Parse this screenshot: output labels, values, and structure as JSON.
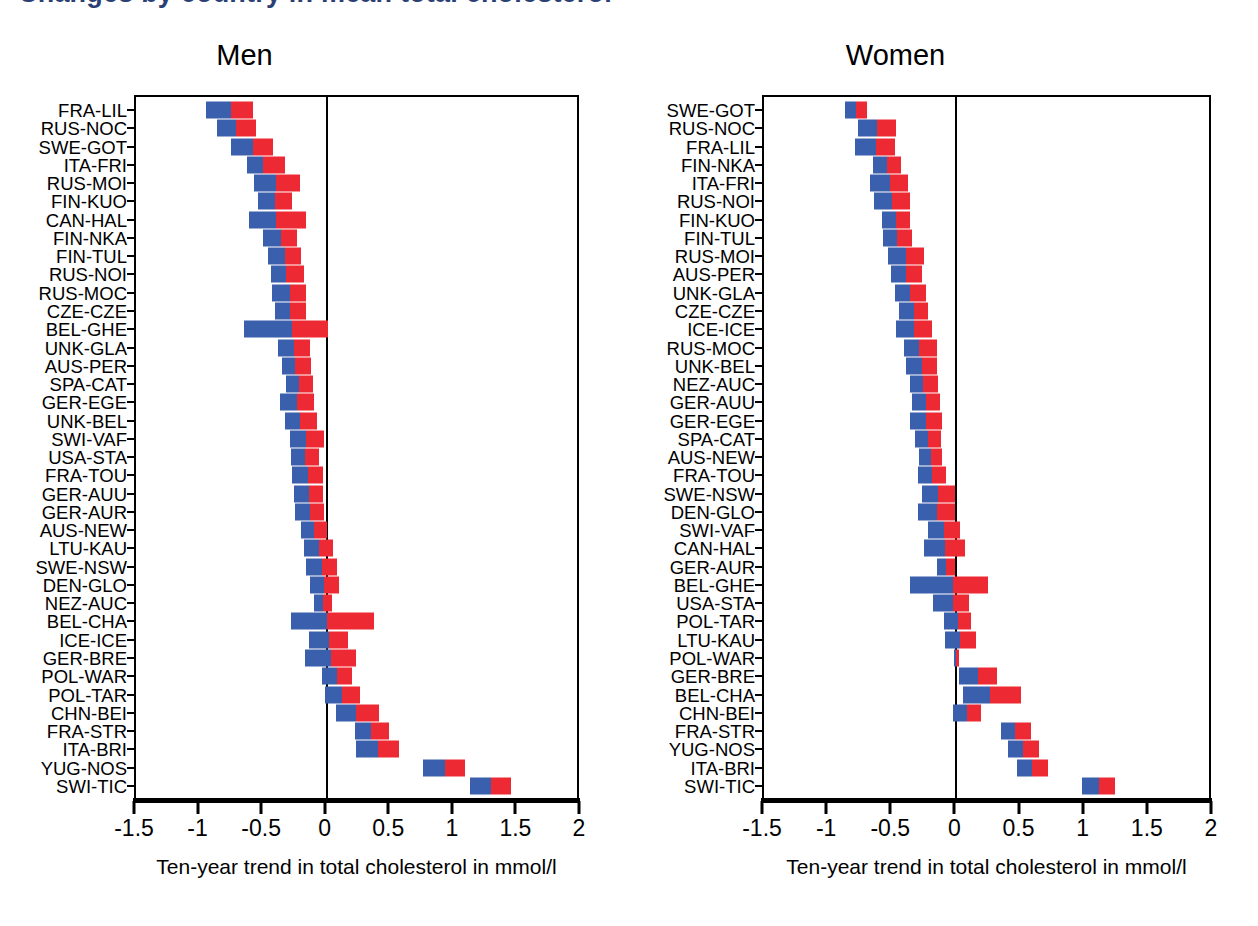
{
  "figure": {
    "cut_heading": "Changes by country in mean total cholesterol",
    "accent_blue": "#3a5fad",
    "accent_red": "#ed2a33",
    "axis_title": "Ten-year trend in total cholesterol in mmol/l"
  },
  "chart_data": [
    {
      "type": "bar",
      "orientation": "horizontal",
      "title": "Men",
      "xlabel": "Ten-year trend in total cholesterol in mmol/l",
      "ylabel": "",
      "xlim": [
        -1.5,
        2
      ],
      "xticks": [
        -1.5,
        -1,
        -0.5,
        0,
        0.5,
        1,
        1.5,
        2
      ],
      "xticklabels": [
        "-1.5",
        "-1",
        "-0.5",
        "0",
        "0.5",
        "1",
        "1.5",
        "2"
      ],
      "grid": false,
      "legend": "none",
      "zero_reference_line": 0,
      "series": [
        {
          "name": "lower-half (blue)",
          "color": "#3a5fad"
        },
        {
          "name": "upper-half (red)",
          "color": "#ed2a33"
        }
      ],
      "categories": [
        "FRA-LIL",
        "RUS-NOC",
        "SWE-GOT",
        "ITA-FRI",
        "RUS-MOI",
        "FIN-KUO",
        "CAN-HAL",
        "FIN-NKA",
        "FIN-TUL",
        "RUS-NOI",
        "RUS-MOC",
        "CZE-CZE",
        "BEL-GHE",
        "UNK-GLA",
        "AUS-PER",
        "SPA-CAT",
        "GER-EGE",
        "UNK-BEL",
        "SWI-VAF",
        "USA-STA",
        "FRA-TOU",
        "GER-AUU",
        "GER-AUR",
        "AUS-NEW",
        "LTU-KAU",
        "SWE-NSW",
        "DEN-GLO",
        "NEZ-AUC",
        "BEL-CHA",
        "ICE-ICE",
        "GER-BRE",
        "POL-WAR",
        "POL-TAR",
        "CHN-BEI",
        "FRA-STR",
        "ITA-BRI",
        "YUG-NOS",
        "SWI-TIC"
      ],
      "points": [
        {
          "category": "FRA-LIL",
          "low": -0.95,
          "mid": -0.75,
          "high": -0.58
        },
        {
          "category": "RUS-NOC",
          "low": -0.86,
          "mid": -0.71,
          "high": -0.56
        },
        {
          "category": "SWE-GOT",
          "low": -0.75,
          "mid": -0.58,
          "high": -0.42
        },
        {
          "category": "ITA-FRI",
          "low": -0.63,
          "mid": -0.5,
          "high": -0.33
        },
        {
          "category": "RUS-MOI",
          "low": -0.57,
          "mid": -0.4,
          "high": -0.21
        },
        {
          "category": "FIN-KUO",
          "low": -0.54,
          "mid": -0.41,
          "high": -0.27
        },
        {
          "category": "CAN-HAL",
          "low": -0.61,
          "mid": -0.4,
          "high": -0.16
        },
        {
          "category": "FIN-NKA",
          "low": -0.5,
          "mid": -0.36,
          "high": -0.23
        },
        {
          "category": "FIN-TUL",
          "low": -0.46,
          "mid": -0.33,
          "high": -0.2
        },
        {
          "category": "RUS-NOI",
          "low": -0.44,
          "mid": -0.32,
          "high": -0.18
        },
        {
          "category": "RUS-MOC",
          "low": -0.43,
          "mid": -0.29,
          "high": -0.16
        },
        {
          "category": "CZE-CZE",
          "low": -0.41,
          "mid": -0.29,
          "high": -0.16
        },
        {
          "category": "BEL-GHE",
          "low": -0.65,
          "mid": -0.27,
          "high": 0.01
        },
        {
          "category": "UNK-GLA",
          "low": -0.38,
          "mid": -0.26,
          "high": -0.13
        },
        {
          "category": "AUS-PER",
          "low": -0.35,
          "mid": -0.25,
          "high": -0.12
        },
        {
          "category": "SPA-CAT",
          "low": -0.32,
          "mid": -0.22,
          "high": -0.11
        },
        {
          "category": "GER-EGE",
          "low": -0.37,
          "mid": -0.23,
          "high": -0.1
        },
        {
          "category": "UNK-BEL",
          "low": -0.33,
          "mid": -0.21,
          "high": -0.08
        },
        {
          "category": "SWI-VAF",
          "low": -0.29,
          "mid": -0.16,
          "high": -0.02
        },
        {
          "category": "USA-STA",
          "low": -0.28,
          "mid": -0.17,
          "high": -0.06
        },
        {
          "category": "FRA-TOU",
          "low": -0.27,
          "mid": -0.15,
          "high": -0.03
        },
        {
          "category": "GER-AUU",
          "low": -0.26,
          "mid": -0.14,
          "high": -0.03
        },
        {
          "category": "GER-AUR",
          "low": -0.25,
          "mid": -0.13,
          "high": -0.02
        },
        {
          "category": "AUS-NEW",
          "low": -0.2,
          "mid": -0.1,
          "high": 0.0
        },
        {
          "category": "LTU-KAU",
          "low": -0.18,
          "mid": -0.06,
          "high": 0.05
        },
        {
          "category": "SWE-NSW",
          "low": -0.16,
          "mid": -0.04,
          "high": 0.08
        },
        {
          "category": "DEN-GLO",
          "low": -0.13,
          "mid": -0.02,
          "high": 0.1
        },
        {
          "category": "NEZ-AUC",
          "low": -0.1,
          "mid": -0.03,
          "high": 0.04
        },
        {
          "category": "BEL-CHA",
          "low": -0.28,
          "mid": 0.0,
          "high": 0.37
        },
        {
          "category": "ICE-ICE",
          "low": -0.14,
          "mid": 0.02,
          "high": 0.17
        },
        {
          "category": "GER-BRE",
          "low": -0.17,
          "mid": 0.03,
          "high": 0.23
        },
        {
          "category": "POL-WAR",
          "low": -0.04,
          "mid": 0.08,
          "high": 0.2
        },
        {
          "category": "POL-TAR",
          "low": -0.01,
          "mid": 0.12,
          "high": 0.26
        },
        {
          "category": "CHN-BEI",
          "low": 0.07,
          "mid": 0.23,
          "high": 0.41
        },
        {
          "category": "FRA-STR",
          "low": 0.22,
          "mid": 0.35,
          "high": 0.49
        },
        {
          "category": "ITA-BRI",
          "low": 0.23,
          "mid": 0.4,
          "high": 0.57
        },
        {
          "category": "YUG-NOS",
          "low": 0.76,
          "mid": 0.93,
          "high": 1.09
        },
        {
          "category": "SWI-TIC",
          "low": 1.13,
          "mid": 1.29,
          "high": 1.45
        }
      ]
    },
    {
      "type": "bar",
      "orientation": "horizontal",
      "title": "Women",
      "xlabel": "Ten-year trend in total cholesterol in mmol/l",
      "ylabel": "",
      "xlim": [
        -1.5,
        2
      ],
      "xticks": [
        -1.5,
        -1,
        -0.5,
        0,
        0.5,
        1,
        1.5,
        2
      ],
      "xticklabels": [
        "-1.5",
        "-1",
        "-0.5",
        "0",
        "0.5",
        "1",
        "1.5",
        "2"
      ],
      "grid": false,
      "legend": "none",
      "zero_reference_line": 0,
      "series": [
        {
          "name": "lower-half (blue)",
          "color": "#3a5fad"
        },
        {
          "name": "upper-half (red)",
          "color": "#ed2a33"
        }
      ],
      "categories": [
        "SWE-GOT",
        "RUS-NOC",
        "FRA-LIL",
        "FIN-NKA",
        "ITA-FRI",
        "RUS-NOI",
        "FIN-KUO",
        "FIN-TUL",
        "RUS-MOI",
        "AUS-PER",
        "UNK-GLA",
        "CZE-CZE",
        "ICE-ICE",
        "RUS-MOC",
        "UNK-BEL",
        "NEZ-AUC",
        "GER-AUU",
        "GER-EGE",
        "SPA-CAT",
        "AUS-NEW",
        "FRA-TOU",
        "SWE-NSW",
        "DEN-GLO",
        "SWI-VAF",
        "CAN-HAL",
        "GER-AUR",
        "BEL-GHE",
        "USA-STA",
        "POL-TAR",
        "LTU-KAU",
        "POL-WAR",
        "GER-BRE",
        "BEL-CHA",
        "CHN-BEI",
        "FRA-STR",
        "YUG-NOS",
        "ITA-BRI",
        "SWI-TIC"
      ],
      "points": [
        {
          "category": "SWE-GOT",
          "low": -0.87,
          "mid": -0.78,
          "high": -0.7
        },
        {
          "category": "RUS-NOC",
          "low": -0.77,
          "mid": -0.62,
          "high": -0.47
        },
        {
          "category": "FRA-LIL",
          "low": -0.79,
          "mid": -0.63,
          "high": -0.48
        },
        {
          "category": "FIN-NKA",
          "low": -0.65,
          "mid": -0.54,
          "high": -0.43
        },
        {
          "category": "ITA-FRI",
          "low": -0.67,
          "mid": -0.52,
          "high": -0.38
        },
        {
          "category": "RUS-NOI",
          "low": -0.64,
          "mid": -0.5,
          "high": -0.36
        },
        {
          "category": "FIN-KUO",
          "low": -0.58,
          "mid": -0.47,
          "high": -0.36
        },
        {
          "category": "FIN-TUL",
          "low": -0.57,
          "mid": -0.46,
          "high": -0.35
        },
        {
          "category": "RUS-MOI",
          "low": -0.53,
          "mid": -0.39,
          "high": -0.25
        },
        {
          "category": "AUS-PER",
          "low": -0.51,
          "mid": -0.39,
          "high": -0.27
        },
        {
          "category": "UNK-GLA",
          "low": -0.48,
          "mid": -0.36,
          "high": -0.24
        },
        {
          "category": "CZE-CZE",
          "low": -0.45,
          "mid": -0.33,
          "high": -0.22
        },
        {
          "category": "ICE-ICE",
          "low": -0.47,
          "mid": -0.33,
          "high": -0.19
        },
        {
          "category": "RUS-MOC",
          "low": -0.41,
          "mid": -0.29,
          "high": -0.15
        },
        {
          "category": "UNK-BEL",
          "low": -0.39,
          "mid": -0.27,
          "high": -0.15
        },
        {
          "category": "NEZ-AUC",
          "low": -0.36,
          "mid": -0.26,
          "high": -0.14
        },
        {
          "category": "GER-AUU",
          "low": -0.35,
          "mid": -0.24,
          "high": -0.13
        },
        {
          "category": "GER-EGE",
          "low": -0.36,
          "mid": -0.24,
          "high": -0.11
        },
        {
          "category": "SPA-CAT",
          "low": -0.32,
          "mid": -0.22,
          "high": -0.12
        },
        {
          "category": "AUS-NEW",
          "low": -0.29,
          "mid": -0.2,
          "high": -0.11
        },
        {
          "category": "FRA-TOU",
          "low": -0.3,
          "mid": -0.19,
          "high": -0.08
        },
        {
          "category": "SWE-NSW",
          "low": -0.27,
          "mid": -0.14,
          "high": -0.01
        },
        {
          "category": "DEN-GLO",
          "low": -0.3,
          "mid": -0.15,
          "high": -0.01
        },
        {
          "category": "SWI-VAF",
          "low": -0.22,
          "mid": -0.1,
          "high": 0.03
        },
        {
          "category": "CAN-HAL",
          "low": -0.25,
          "mid": -0.09,
          "high": 0.07
        },
        {
          "category": "GER-AUR",
          "low": -0.15,
          "mid": -0.08,
          "high": -0.01
        },
        {
          "category": "BEL-GHE",
          "low": -0.36,
          "mid": -0.03,
          "high": 0.25
        },
        {
          "category": "USA-STA",
          "low": -0.18,
          "mid": -0.03,
          "high": 0.1
        },
        {
          "category": "POL-TAR",
          "low": -0.1,
          "mid": 0.01,
          "high": 0.11
        },
        {
          "category": "LTU-KAU",
          "low": -0.09,
          "mid": 0.03,
          "high": 0.15
        },
        {
          "category": "POL-WAR",
          "low": -0.02,
          "mid": 0.0,
          "high": 0.02
        },
        {
          "category": "GER-BRE",
          "low": 0.02,
          "mid": 0.17,
          "high": 0.32
        },
        {
          "category": "BEL-CHA",
          "low": 0.05,
          "mid": 0.26,
          "high": 0.5
        },
        {
          "category": "CHN-BEI",
          "low": -0.03,
          "mid": 0.08,
          "high": 0.19
        },
        {
          "category": "FRA-STR",
          "low": 0.35,
          "mid": 0.46,
          "high": 0.58
        },
        {
          "category": "YUG-NOS",
          "low": 0.4,
          "mid": 0.52,
          "high": 0.64
        },
        {
          "category": "ITA-BRI",
          "low": 0.47,
          "mid": 0.59,
          "high": 0.71
        },
        {
          "category": "SWI-TIC",
          "low": 0.98,
          "mid": 1.11,
          "high": 1.24
        }
      ]
    }
  ]
}
